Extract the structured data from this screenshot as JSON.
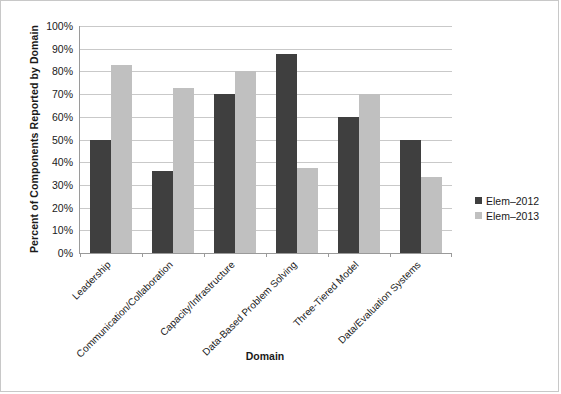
{
  "chart_data": {
    "type": "bar",
    "title": "",
    "xlabel": "Domain",
    "ylabel": "Percent of Components Reported by Domain",
    "ylim": [
      0,
      100
    ],
    "ytick_labels": [
      "100%",
      "90%",
      "80%",
      "70%",
      "60%",
      "50%",
      "40%",
      "30%",
      "20%",
      "10%",
      "0%"
    ],
    "ytick_values": [
      100,
      90,
      80,
      70,
      60,
      50,
      40,
      30,
      20,
      10,
      0
    ],
    "grid": "horizontal",
    "legend_position": "right",
    "categories": [
      "Leadership",
      "Communication/Collaboration",
      "Capacity/Infrastructure",
      "Data-Based Problem Solving",
      "Three-Tiered Model",
      "Data/Evaluation Systems"
    ],
    "series": [
      {
        "name": "Elem–2012",
        "color": "#3f3f3f",
        "values": [
          50,
          36,
          70,
          87.5,
          60,
          50
        ]
      },
      {
        "name": "Elem–2013",
        "color": "#c0c0c0",
        "values": [
          83,
          72.5,
          80,
          37.5,
          70,
          33.5
        ]
      }
    ]
  },
  "legend": {
    "items": [
      {
        "label": "Elem–2012",
        "color": "#3f3f3f"
      },
      {
        "label": "Elem–2013",
        "color": "#c0c0c0"
      }
    ]
  },
  "colors": {
    "series_2012": "#3f3f3f",
    "series_2013": "#c0c0c0",
    "gridline": "#c9c9c9",
    "axis": "#9a9a9a",
    "border": "#c8c8c8",
    "text": "#1a1a1a",
    "background": "#ffffff"
  }
}
